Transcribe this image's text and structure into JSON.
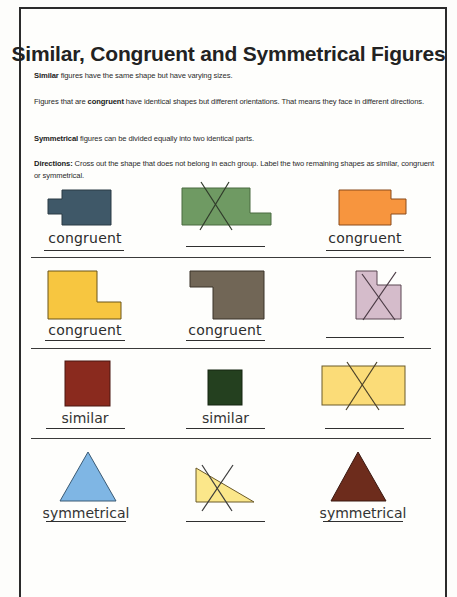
{
  "worksheet": {
    "title": "Similar, Congruent and Symmetrical Figures",
    "definitions": [
      {
        "term": "Similar",
        "text": " figures have the same shape but have varying sizes."
      },
      {
        "prefix": "Figures that are ",
        "term": "congruent",
        "text": " have identical shapes but different orientations. That means they face in different directions."
      },
      {
        "term": "Symmetrical",
        "text": " figures can be divided equally into two identical parts."
      }
    ],
    "directions": {
      "label": "Directions:",
      "text": " Cross out the shape that does not belong in each group. Label the two remaining shapes as similar, congruent or symmetrical."
    }
  },
  "rows": [
    {
      "items": [
        {
          "shape": "rectangle-with-left-tab",
          "color": "#3f5868",
          "crossed": false,
          "label": "congruent"
        },
        {
          "shape": "stepped-rectangle",
          "color": "#6f9a63",
          "crossed": true,
          "label": ""
        },
        {
          "shape": "rectangle-with-right-tab",
          "color": "#f7953e",
          "crossed": false,
          "label": "congruent"
        }
      ]
    },
    {
      "items": [
        {
          "shape": "l-shape",
          "color": "#f7c640",
          "crossed": false,
          "label": "congruent"
        },
        {
          "shape": "inverted-l-shape",
          "color": "#716656",
          "crossed": false,
          "label": "congruent"
        },
        {
          "shape": "notched-square",
          "color": "#d5bccb",
          "crossed": true,
          "label": ""
        }
      ]
    },
    {
      "items": [
        {
          "shape": "large-square",
          "color": "#8a2a1e",
          "crossed": false,
          "label": "similar"
        },
        {
          "shape": "small-square",
          "color": "#24401f",
          "crossed": false,
          "label": "similar"
        },
        {
          "shape": "rectangle",
          "color": "#fbdc78",
          "crossed": true,
          "label": ""
        }
      ]
    },
    {
      "items": [
        {
          "shape": "isosceles-triangle",
          "color": "#7fb6e4",
          "crossed": false,
          "label": "symmetrical"
        },
        {
          "shape": "right-triangle",
          "color": "#fbe78a",
          "crossed": true,
          "label": ""
        },
        {
          "shape": "isosceles-triangle",
          "color": "#6d2c1c",
          "crossed": false,
          "label": "symmetrical"
        }
      ]
    }
  ]
}
